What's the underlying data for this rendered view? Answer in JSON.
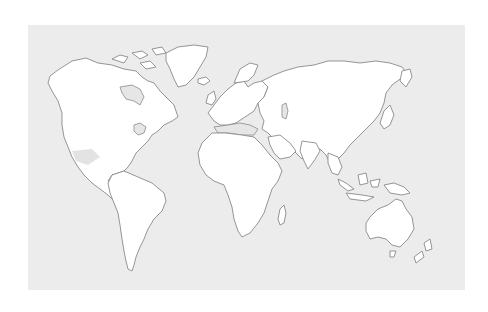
{
  "map": {
    "type": "world-outline",
    "colors": {
      "ocean": "#ececec",
      "land": "#ffffff",
      "coastline": "#8a8a8a",
      "inland_water": "#e6e6e6",
      "highlight": "#e3e3e3",
      "page_background": "#ffffff"
    },
    "regions": [
      {
        "name": "North America"
      },
      {
        "name": "Greenland"
      },
      {
        "name": "South America"
      },
      {
        "name": "Europe"
      },
      {
        "name": "Africa"
      },
      {
        "name": "Asia"
      },
      {
        "name": "Australia"
      },
      {
        "name": "New Zealand"
      },
      {
        "name": "Madagascar"
      },
      {
        "name": "Japan"
      },
      {
        "name": "Indonesia"
      },
      {
        "name": "United Kingdom"
      },
      {
        "name": "Iceland"
      }
    ],
    "labels": []
  }
}
